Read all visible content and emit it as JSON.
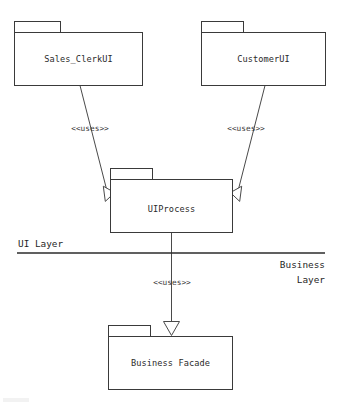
{
  "diagram": {
    "type": "uml-package-diagram",
    "stroke_color": "#3a3a3a",
    "fill_color": "#ffffff",
    "background": "#ffffff",
    "packages": [
      {
        "id": "sales-clerk-ui",
        "label": "Sales_ClerkUI",
        "x": 14,
        "y": 21,
        "width": 128,
        "height": 64,
        "tab_width": 46,
        "tab_height": 11
      },
      {
        "id": "customer-ui",
        "label": "CustomerUI",
        "x": 201,
        "y": 21,
        "width": 124,
        "height": 64,
        "tab_width": 42,
        "tab_height": 11
      },
      {
        "id": "ui-process",
        "label": "UIProcess",
        "x": 110,
        "y": 168,
        "width": 122,
        "height": 65,
        "tab_width": 42,
        "tab_height": 11
      },
      {
        "id": "business-facade",
        "label": "Business Facade",
        "x": 108,
        "y": 325,
        "width": 124,
        "height": 64,
        "tab_width": 42,
        "tab_height": 11
      }
    ],
    "dependencies": [
      {
        "id": "sales-clerk-to-uiprocess",
        "from": "sales-clerk-ui",
        "to": "ui-process",
        "stereotype": "<<uses>>",
        "label_x": 90,
        "label_y": 131
      },
      {
        "id": "customer-to-uiprocess",
        "from": "customer-ui",
        "to": "ui-process",
        "stereotype": "<<uses>>",
        "label_x": 246,
        "label_y": 131
      },
      {
        "id": "uiprocess-to-facade",
        "from": "ui-process",
        "to": "business-facade",
        "stereotype": "<<uses>>",
        "label_x": 172,
        "label_y": 285
      }
    ],
    "layers": [
      {
        "id": "ui-layer",
        "label": "UI Layer",
        "position": "above-left",
        "x": 18,
        "y": 247
      },
      {
        "id": "business-layer",
        "label_line1": "Business",
        "label_line2": "Layer",
        "position": "below-right",
        "x": 325,
        "y1": 268,
        "y2": 283
      }
    ],
    "divider": {
      "id": "layer-divider",
      "x1": 17,
      "x2": 325,
      "y": 253
    }
  }
}
